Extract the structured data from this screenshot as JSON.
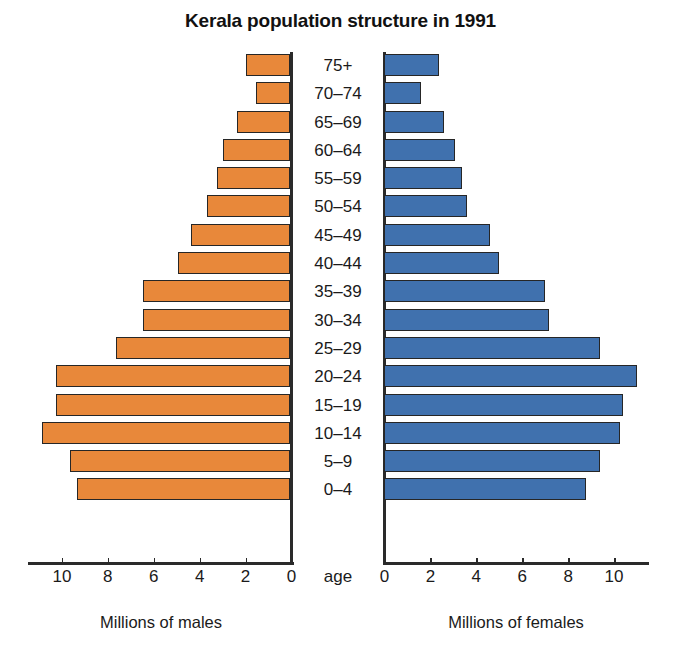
{
  "chart_data": {
    "type": "bar",
    "subtype": "population-pyramid",
    "title": "Kerala population structure in 1991",
    "categories": [
      "75+",
      "70–74",
      "65–69",
      "60–64",
      "55–59",
      "50–54",
      "45–49",
      "40–44",
      "35–39",
      "30–34",
      "25–29",
      "20–24",
      "15–19",
      "10–14",
      "5–9",
      "0–4"
    ],
    "category_axis_label": "age",
    "series": [
      {
        "name": "Millions of males",
        "side": "left",
        "color": "#E8883A",
        "values": [
          1.9,
          1.5,
          2.3,
          2.9,
          3.2,
          3.6,
          4.3,
          4.9,
          6.4,
          6.4,
          7.6,
          10.2,
          10.2,
          10.8,
          9.6,
          9.3
        ]
      },
      {
        "name": "Millions of females",
        "side": "right",
        "color": "#4071AE",
        "values": [
          2.4,
          1.6,
          2.6,
          3.1,
          3.4,
          3.6,
          4.6,
          5.0,
          7.0,
          7.2,
          9.4,
          11.0,
          10.4,
          10.3,
          9.4,
          8.8
        ]
      }
    ],
    "left_axis": {
      "label": "Millions of males",
      "ticks": [
        "10",
        "8",
        "6",
        "4",
        "2",
        "0"
      ],
      "tick_values": [
        10,
        8,
        6,
        4,
        2,
        0
      ],
      "range": [
        0,
        11.5
      ],
      "direction": "reversed"
    },
    "right_axis": {
      "label": "Millions of females",
      "ticks": [
        "0",
        "2",
        "4",
        "6",
        "8",
        "10"
      ],
      "tick_values": [
        0,
        2,
        4,
        6,
        8,
        10
      ],
      "range": [
        0,
        11.5
      ],
      "direction": "normal"
    },
    "xlabel": "Millions of people",
    "ylabel": "age",
    "grid": false,
    "legend": "none",
    "colors": {
      "male_bar": "#E8883A",
      "female_bar": "#4071AE",
      "bar_outline": "#262626",
      "axis": "#2a2a2a",
      "text": "#1a1a1a",
      "background": "#ffffff"
    }
  }
}
